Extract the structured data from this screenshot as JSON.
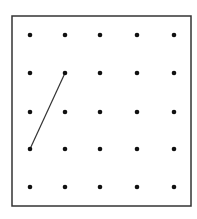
{
  "diagram": {
    "type": "geoboard-dot-grid",
    "frame": {
      "x": 12,
      "y": 16,
      "width": 179,
      "height": 190,
      "stroke": "#333333"
    },
    "grid": {
      "rows": 5,
      "cols": 5,
      "xs": [
        30,
        65,
        100,
        137,
        174
      ],
      "ys": [
        35,
        73,
        112,
        149,
        187
      ],
      "dot_color": "#111111",
      "dot_radius": 2.3
    },
    "segments": [
      {
        "from": {
          "col": 0,
          "row": 3
        },
        "to": {
          "col": 1,
          "row": 1
        },
        "color": "#333333"
      }
    ]
  }
}
